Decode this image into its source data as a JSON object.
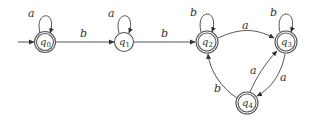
{
  "diagram": {
    "type": "finite-automaton",
    "states": [
      {
        "id": "q0",
        "name": "q",
        "sub": "0",
        "x": 45,
        "y": 42,
        "accepting": true,
        "initial": true
      },
      {
        "id": "q1",
        "name": "q",
        "sub": "1",
        "x": 124,
        "y": 42,
        "accepting": false,
        "initial": false
      },
      {
        "id": "q2",
        "name": "q",
        "sub": "2",
        "x": 207,
        "y": 42,
        "accepting": true,
        "initial": false
      },
      {
        "id": "q3",
        "name": "q",
        "sub": "3",
        "x": 286,
        "y": 42,
        "accepting": true,
        "initial": false
      },
      {
        "id": "q4",
        "name": "q",
        "sub": "4",
        "x": 247,
        "y": 103,
        "accepting": true,
        "initial": false
      }
    ],
    "transitions": [
      {
        "from": "q0",
        "to": "q0",
        "label": "a"
      },
      {
        "from": "q0",
        "to": "q1",
        "label": "b"
      },
      {
        "from": "q1",
        "to": "q1",
        "label": "a"
      },
      {
        "from": "q1",
        "to": "q2",
        "label": "b"
      },
      {
        "from": "q2",
        "to": "q2",
        "label": "b"
      },
      {
        "from": "q2",
        "to": "q3",
        "label": "a"
      },
      {
        "from": "q3",
        "to": "q3",
        "label": "b"
      },
      {
        "from": "q3",
        "to": "q4",
        "label": "a"
      },
      {
        "from": "q4",
        "to": "q3",
        "label": "a"
      },
      {
        "from": "q4",
        "to": "q2",
        "label": "b"
      }
    ],
    "labels": {
      "loop_q0": "a",
      "q0_q1": "b",
      "loop_q1": "a",
      "q1_q2": "b",
      "loop_q2": "b",
      "q2_q3": "a",
      "loop_q3": "b",
      "q3_q4": "a",
      "q4_q3": "a",
      "q4_q2": "b"
    },
    "state_names": {
      "q0": "q",
      "q1": "q",
      "q2": "q",
      "q3": "q",
      "q4": "q"
    },
    "state_subs": {
      "q0": "0",
      "q1": "1",
      "q2": "2",
      "q3": "3",
      "q4": "4"
    },
    "colors": {
      "stroke": "#555555",
      "text": "#333333",
      "background": "#ffffff"
    }
  }
}
